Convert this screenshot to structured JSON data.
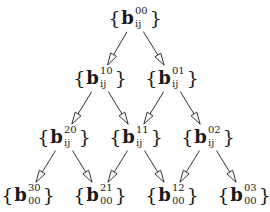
{
  "diagram": {
    "type": "tree",
    "nodes": [
      {
        "id": "n00",
        "level": 0,
        "base": "b",
        "sup": "00",
        "sub": "ij",
        "x": 135,
        "y": 18
      },
      {
        "id": "n10",
        "level": 1,
        "base": "b",
        "sup": "10",
        "sub": "ij",
        "x": 100,
        "y": 78
      },
      {
        "id": "n01",
        "level": 1,
        "base": "b",
        "sup": "01",
        "sub": "ij",
        "x": 172,
        "y": 78
      },
      {
        "id": "n20",
        "level": 2,
        "base": "b",
        "sup": "20",
        "sub": "ij",
        "x": 64,
        "y": 137
      },
      {
        "id": "n11",
        "level": 2,
        "base": "b",
        "sup": "11",
        "sub": "ij",
        "x": 136,
        "y": 137
      },
      {
        "id": "n02",
        "level": 2,
        "base": "b",
        "sup": "02",
        "sub": "ij",
        "x": 208,
        "y": 137
      },
      {
        "id": "n30",
        "level": 3,
        "base": "b",
        "sup": "30",
        "sub": "00",
        "x": 28,
        "y": 195
      },
      {
        "id": "n21",
        "level": 3,
        "base": "b",
        "sup": "21",
        "sub": "00",
        "x": 100,
        "y": 195
      },
      {
        "id": "n12",
        "level": 3,
        "base": "b",
        "sup": "12",
        "sub": "00",
        "x": 172,
        "y": 195
      },
      {
        "id": "n03",
        "level": 3,
        "base": "b",
        "sup": "03",
        "sub": "00",
        "x": 244,
        "y": 195
      }
    ],
    "edges": [
      {
        "from": "n00",
        "to": "n10"
      },
      {
        "from": "n00",
        "to": "n01"
      },
      {
        "from": "n10",
        "to": "n20"
      },
      {
        "from": "n10",
        "to": "n11"
      },
      {
        "from": "n01",
        "to": "n11"
      },
      {
        "from": "n01",
        "to": "n02"
      },
      {
        "from": "n20",
        "to": "n30"
      },
      {
        "from": "n20",
        "to": "n21"
      },
      {
        "from": "n11",
        "to": "n21"
      },
      {
        "from": "n11",
        "to": "n12"
      },
      {
        "from": "n02",
        "to": "n12"
      },
      {
        "from": "n02",
        "to": "n03"
      }
    ],
    "brace_open": "{",
    "brace_close": "}",
    "colors": {
      "ink": "#1a1a1a",
      "background": "#ffffff"
    }
  }
}
